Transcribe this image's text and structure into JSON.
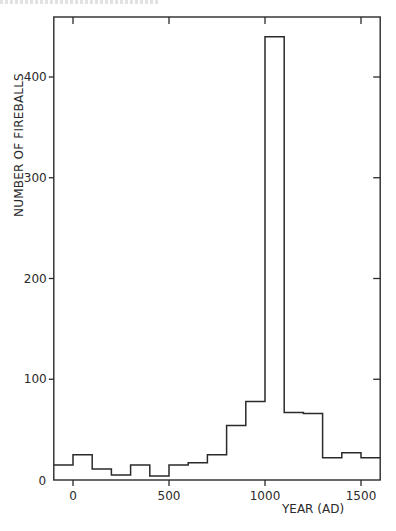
{
  "page": {
    "running_header_visible": "clipped"
  },
  "chart_data": {
    "type": "bar",
    "subtype": "histogram-step",
    "title": "",
    "xlabel": "YEAR (AD)",
    "ylabel": "NUMBER OF FIREBALLS",
    "xlim": [
      -100,
      1600
    ],
    "ylim": [
      0,
      450
    ],
    "x_ticks": [
      0,
      500,
      1000,
      1500
    ],
    "y_ticks": [
      0,
      100,
      200,
      300,
      400
    ],
    "bin_width": 100,
    "bin_starts": [
      -100,
      0,
      100,
      200,
      300,
      400,
      500,
      600,
      700,
      800,
      900,
      1000,
      1100,
      1200,
      1300,
      1400,
      1500
    ],
    "categories": [
      "-100–0",
      "0–100",
      "100–200",
      "200–300",
      "300–400",
      "400–500",
      "500–600",
      "600–700",
      "700–800",
      "800–900",
      "900–1000",
      "1000–1100",
      "1100–1200",
      "1200–1300",
      "1300–1400",
      "1400–1500",
      "1500–1600"
    ],
    "values": [
      15,
      25,
      11,
      5,
      15,
      4,
      15,
      17,
      25,
      54,
      78,
      440,
      67,
      66,
      22,
      27,
      22
    ],
    "grid": false,
    "legend": null,
    "frame": "box with inward ticks on all sides"
  },
  "axes": {
    "x_tick_labels": [
      "0",
      "500",
      "1000",
      "1500"
    ],
    "y_tick_labels": [
      "0",
      "100",
      "200",
      "300",
      "400"
    ]
  }
}
